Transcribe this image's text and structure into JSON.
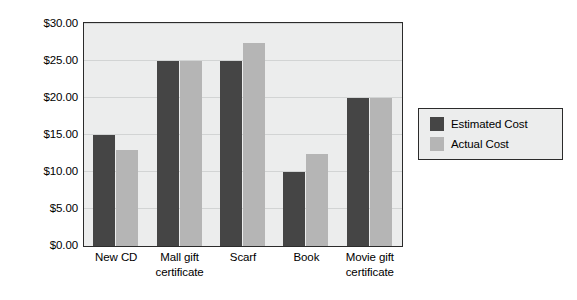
{
  "chart_data": {
    "type": "bar",
    "title": "",
    "subtitle": "",
    "xlabel": "",
    "ylabel": "",
    "categories": [
      "New CD",
      "Mall gift\ncertificate",
      "Scarf",
      "Book",
      "Movie gift\ncertificate"
    ],
    "series": [
      {
        "name": "Estimated Cost",
        "values": [
          15.0,
          25.0,
          25.0,
          10.0,
          20.0
        ],
        "color": "#454545"
      },
      {
        "name": "Actual Cost",
        "values": [
          13.0,
          25.0,
          27.5,
          12.5,
          20.0
        ],
        "color": "#b5b5b5"
      }
    ],
    "ylim": [
      0,
      30
    ],
    "ytick_step": 5,
    "ytick_labels": [
      "$30.00",
      "$25.00",
      "$20.00",
      "$15.00",
      "$10.00",
      "$5.00",
      "$0.00"
    ],
    "ytick_values": [
      30,
      25,
      20,
      15,
      10,
      5,
      0
    ],
    "grid": true,
    "legend_position": "right",
    "value_prefix": "$",
    "annotations": []
  },
  "legend": {
    "entries": [
      {
        "label": "Estimated Cost"
      },
      {
        "label": "Actual Cost"
      }
    ]
  },
  "axes": {
    "y_labels": [
      "$30.00",
      "$25.00",
      "$20.00",
      "$15.00",
      "$10.00",
      "$5.00",
      "$0.00"
    ],
    "x_labels": [
      "New CD",
      "Mall gift certificate",
      "Scarf",
      "Book",
      "Movie gift certificate"
    ]
  },
  "colors": {
    "estimated": "#454545",
    "actual": "#b5b5b5",
    "plot_background": "#eceded",
    "gridline": "#d2d4d4",
    "frame": "#2b2b2b",
    "page_background": "#ffffff"
  }
}
